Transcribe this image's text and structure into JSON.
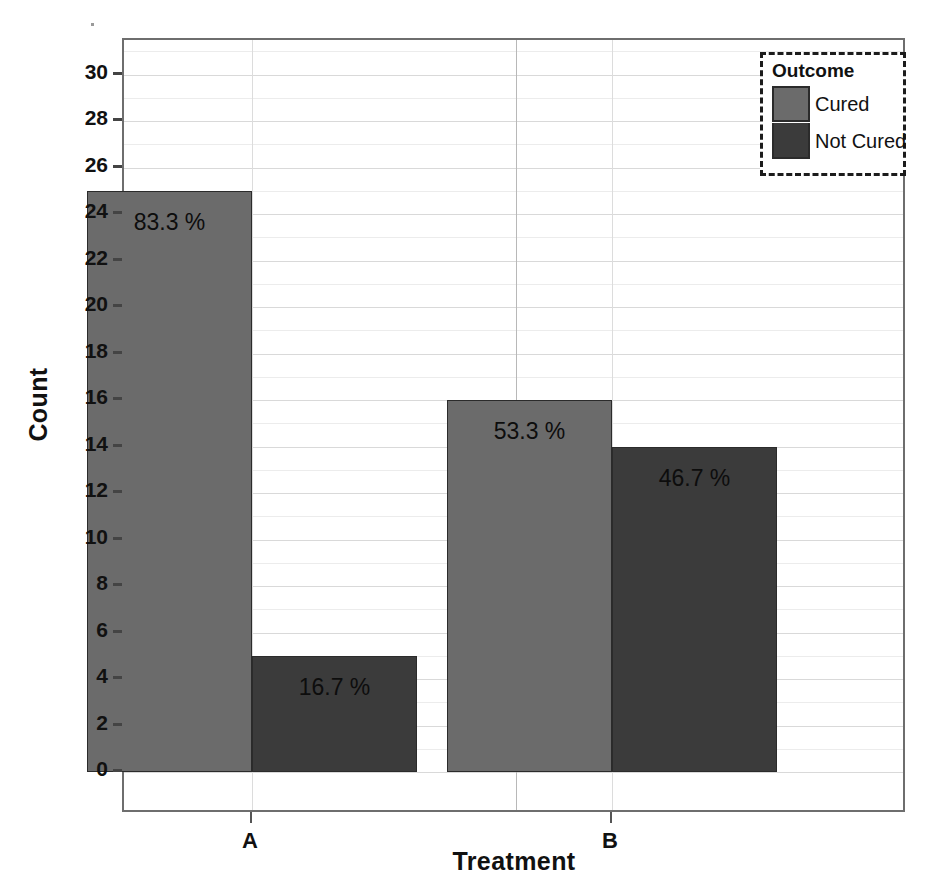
{
  "chart_data": {
    "type": "bar",
    "title": "",
    "subtitle": "",
    "xlabel": "Treatment",
    "ylabel": "Count",
    "categories": [
      "A",
      "B"
    ],
    "series": [
      {
        "name": "Cured",
        "values": [
          25,
          16
        ],
        "color": "#6b6b6b"
      },
      {
        "name": "Not Cured",
        "values": [
          5,
          14
        ],
        "color": "#3b3b3b"
      }
    ],
    "bar_labels": [
      {
        "category": "A",
        "series": "Cured",
        "text": "83.3 %",
        "value": 83.3
      },
      {
        "category": "A",
        "series": "Not Cured",
        "text": "16.7 %",
        "value": 16.7
      },
      {
        "category": "B",
        "series": "Cured",
        "text": "53.3 %",
        "value": 53.3
      },
      {
        "category": "B",
        "series": "Not Cured",
        "text": "46.7 %",
        "value": 46.7
      }
    ],
    "ylim": [
      0,
      31
    ],
    "yticks": [
      0,
      2,
      4,
      6,
      8,
      10,
      12,
      14,
      16,
      18,
      20,
      22,
      24,
      26,
      28,
      30
    ],
    "ytick_labels": [
      "0",
      "2",
      "4",
      "6",
      "8",
      "10",
      "12",
      "14",
      "16",
      "18",
      "20",
      "22",
      "24",
      "26",
      "28",
      "30"
    ],
    "grid": true,
    "grid_axis": "y",
    "legend": {
      "title": "Outcome",
      "position": "top-right",
      "entries": [
        "Cured",
        "Not Cured"
      ]
    },
    "bar_mode": "grouped-adjacent",
    "colors": {
      "cured": "#6b6b6b",
      "not_cured": "#3b3b3b",
      "frame": "#6e6e6e",
      "grid": "#d9d9d9",
      "text": "#111111"
    }
  },
  "axes": {
    "y_title": "Count",
    "x_title": "Treatment",
    "ytick_labels": [
      "30",
      "28",
      "26",
      "24",
      "22",
      "20",
      "18",
      "16",
      "14",
      "12",
      "10",
      "8",
      "6",
      "4",
      "2",
      "0"
    ],
    "xtick_labels": [
      "A",
      "B"
    ]
  },
  "legend": {
    "title": "Outcome",
    "items": [
      {
        "label": "Cured"
      },
      {
        "label": "Not Cured"
      }
    ]
  },
  "bars": [
    {
      "label": "83.3 %"
    },
    {
      "label": "16.7 %"
    },
    {
      "label": "53.3 %"
    },
    {
      "label": "46.7 %"
    }
  ]
}
